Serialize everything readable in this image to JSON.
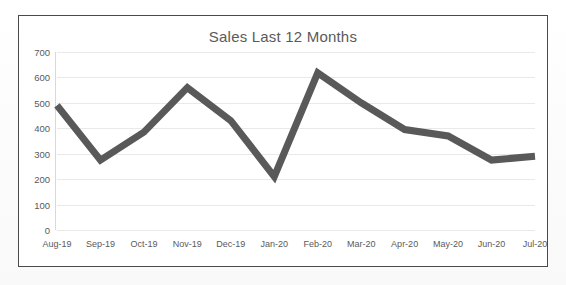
{
  "chart_data": {
    "type": "line",
    "title": "Sales Last 12 Months",
    "xlabel": "",
    "ylabel": "",
    "categories": [
      "Aug-19",
      "Sep-19",
      "Oct-19",
      "Nov-19",
      "Dec-19",
      "Jan-20",
      "Feb-20",
      "Mar-20",
      "Apr-20",
      "May-20",
      "Jun-20",
      "Jul-20"
    ],
    "values": [
      490,
      275,
      385,
      560,
      430,
      210,
      618,
      500,
      395,
      370,
      275,
      290
    ],
    "series": [
      {
        "name": "Sales",
        "values": [
          490,
          275,
          385,
          560,
          430,
          210,
          618,
          500,
          395,
          370,
          275,
          290
        ]
      }
    ],
    "ylim": [
      0,
      700
    ],
    "yticks": [
      0,
      100,
      200,
      300,
      400,
      500,
      600,
      700
    ],
    "ytick_labels": [
      "0",
      "100",
      "200",
      "300",
      "400",
      "500",
      "600",
      "700"
    ],
    "grid": true,
    "legend": false,
    "legend_position": "none",
    "line_color": "#595959",
    "grid_color": "#e9e9e9",
    "text_color": "#5a5a5a",
    "border_color": "#4a4a4a",
    "background_color": "#ffffff"
  }
}
